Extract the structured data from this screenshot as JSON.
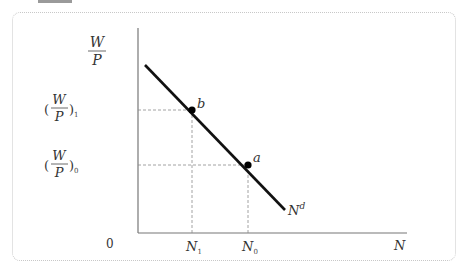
{
  "diagram": {
    "type": "labor-demand-curve",
    "y_axis_label": {
      "num": "W",
      "den": "P"
    },
    "x_axis_label": "N",
    "origin_label": "0",
    "curve_label": {
      "base": "N",
      "sup": "d"
    },
    "y_ticks": [
      {
        "num": "W",
        "den": "P",
        "sub": "1",
        "y": 110
      },
      {
        "num": "W",
        "den": "P",
        "sub": "0",
        "y": 165
      }
    ],
    "x_ticks": [
      {
        "base": "N",
        "sub": "1",
        "x": 192
      },
      {
        "base": "N",
        "sub": "0",
        "x": 248
      }
    ],
    "points": [
      {
        "label": "b",
        "x": 192,
        "y": 110
      },
      {
        "label": "a",
        "x": 248,
        "y": 165
      }
    ],
    "line": {
      "x1": 145,
      "y1": 65,
      "x2": 285,
      "y2": 210
    },
    "colors": {
      "line": "#111111",
      "axis": "#777777",
      "dashed": "#8a8a8a",
      "frame": "#c8c8c8"
    }
  }
}
